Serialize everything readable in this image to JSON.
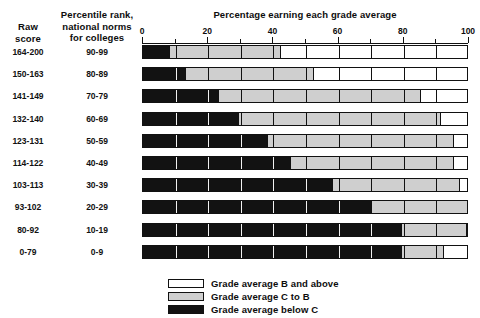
{
  "headers": {
    "raw_score": "Raw\nscore",
    "raw_score_line1": "Raw",
    "raw_score_line2": "score",
    "percentile_line1": "Percentile rank,",
    "percentile_line2": "national norms",
    "percentile_line3": "for colleges"
  },
  "chart_data": {
    "type": "bar",
    "orientation": "horizontal",
    "stacked": true,
    "normalized_percent": true,
    "title": "Percentage earning each grade average",
    "xlabel": "",
    "ylabel": "",
    "xlim": [
      0,
      100
    ],
    "xticks": [
      0,
      20,
      40,
      60,
      80,
      100
    ],
    "xtick_labels": [
      "0",
      "20",
      "40",
      "60",
      "80",
      "100"
    ],
    "minor_tick_step": 10,
    "grid": false,
    "legend_position": "bottom",
    "categories": [
      "164-200",
      "150-163",
      "141-149",
      "132-140",
      "123-131",
      "114-122",
      "103-113",
      "93-102",
      "80-92",
      "0-79"
    ],
    "category_secondary": [
      "90-99",
      "80-89",
      "70-79",
      "60-69",
      "50-59",
      "40-49",
      "30-39",
      "20-29",
      "10-19",
      "0-9"
    ],
    "series": [
      {
        "name": "Grade average below C",
        "color": "#121212",
        "values": [
          8,
          13,
          23,
          29,
          38,
          45,
          58,
          70,
          79,
          79
        ]
      },
      {
        "name": "Grade average C to B",
        "color": "#cfcfcf",
        "values": [
          34,
          39,
          62,
          62,
          57,
          50,
          39,
          30,
          20,
          13
        ]
      },
      {
        "name": "Grade average B and above",
        "color": "#ffffff",
        "values": [
          58,
          48,
          15,
          9,
          5,
          5,
          3,
          0,
          1,
          8
        ]
      }
    ]
  },
  "legend": {
    "items": [
      {
        "label": "Grade average B and above",
        "swatch": "b-above"
      },
      {
        "label": "Grade average C to B",
        "swatch": "c-to-b"
      },
      {
        "label": "Grade average below C",
        "swatch": "below-c"
      }
    ]
  }
}
